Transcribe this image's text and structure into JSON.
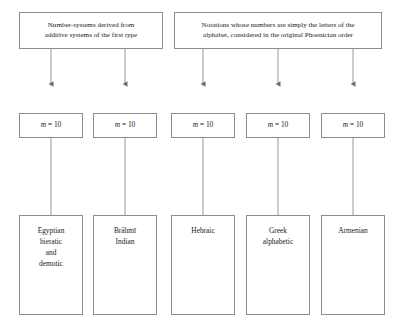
{
  "diagram": {
    "stroke_color": "#8c8c8c",
    "text_color": "#1a1a1a",
    "background": "#ffffff",
    "top_nodes": [
      {
        "id": "additive-first-type",
        "text": "Number-systems derived from\nadditive systems of the first type"
      },
      {
        "id": "phoenician-order",
        "text": "Notations whose numbers are simply the letters of the\nalphabet, considered in the original Phoenician order"
      }
    ],
    "base_nodes": [
      {
        "id": "base-egyptian",
        "var": "m",
        "rest": " = 10"
      },
      {
        "id": "base-brahmi",
        "var": "m",
        "rest": " = 10"
      },
      {
        "id": "base-hebraic",
        "var": "m",
        "rest": " = 10"
      },
      {
        "id": "base-greek",
        "var": "m",
        "rest": " = 10"
      },
      {
        "id": "base-armenian",
        "var": "m",
        "rest": " = 10"
      }
    ],
    "bottom_nodes": [
      {
        "id": "system-egyptian",
        "text": "Egyptian\nhieratic\nand\ndemotic"
      },
      {
        "id": "system-brahmi",
        "text": "Brāhmī\nIndian"
      },
      {
        "id": "system-hebraic",
        "text": "Hebraic"
      },
      {
        "id": "system-greek",
        "text": "Greek\nalphabetic"
      },
      {
        "id": "system-armenian",
        "text": "Armenian"
      }
    ]
  }
}
